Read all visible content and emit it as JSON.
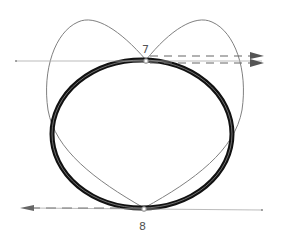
{
  "diagram": {
    "type": "geometric curve diagram",
    "background": "#ffffff",
    "colors": {
      "ellipse_stroke": "#111111",
      "ellipse_inner": "#6a6a6a",
      "curve_stroke": "#7a7a7a",
      "line_stroke": "#999999",
      "dashed_stroke": "#666666",
      "arrow_fill": "#555555",
      "label_color": "#555555"
    },
    "points": [
      {
        "id": "7",
        "label": "7",
        "x": 146,
        "y": 60
      },
      {
        "id": "8",
        "label": "8",
        "x": 144,
        "y": 208
      }
    ],
    "labels": {
      "top": "7",
      "bottom": "8"
    }
  }
}
